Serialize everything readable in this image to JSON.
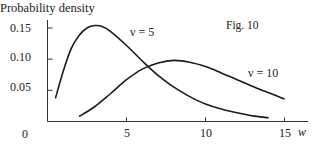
{
  "chart_data": {
    "type": "line",
    "title": "",
    "figure_label": "Fig. 10",
    "xlabel": "w",
    "ylabel": "Probability density",
    "xlim": [
      0,
      16
    ],
    "ylim": [
      0,
      0.16
    ],
    "grid": false,
    "legend": "none (inline curve annotations)",
    "x_ticks": [
      5,
      10,
      15
    ],
    "x_tick_labels": [
      "5",
      "10",
      "15"
    ],
    "y_ticks": [
      0.05,
      0.1,
      0.15
    ],
    "y_tick_labels": [
      "0.05",
      "0.10",
      "0.15"
    ],
    "origin_label": "0",
    "series": [
      {
        "name": "ν = 5",
        "annotation": "ν = 5",
        "x": [
          0.5,
          1,
          1.5,
          2,
          2.5,
          3,
          3.5,
          4,
          5,
          6,
          7,
          8,
          9,
          10,
          11,
          12,
          13,
          14
        ],
        "values": [
          0.037,
          0.081,
          0.117,
          0.138,
          0.15,
          0.154,
          0.152,
          0.144,
          0.122,
          0.097,
          0.074,
          0.055,
          0.04,
          0.028,
          0.02,
          0.014,
          0.009,
          0.006
        ]
      },
      {
        "name": "ν = 10",
        "annotation": "ν = 10",
        "x": [
          2,
          3,
          4,
          5,
          6,
          7,
          8,
          9,
          10,
          11,
          12,
          13,
          14,
          15
        ],
        "values": [
          0.008,
          0.024,
          0.045,
          0.067,
          0.084,
          0.094,
          0.098,
          0.095,
          0.088,
          0.078,
          0.067,
          0.056,
          0.046,
          0.036
        ]
      }
    ]
  },
  "labels": {
    "ylabel": "Probability density",
    "figure": "Fig. 10",
    "origin": "0",
    "xlabel": "w",
    "y_ticks": [
      "0.15",
      "0.10",
      "0.05"
    ],
    "x_ticks": [
      "5",
      "10",
      "15"
    ],
    "series_annotations": [
      "ν = 5",
      "ν = 10"
    ]
  },
  "colors": {
    "line": "#1a1a1a",
    "axis": "#333333",
    "background": "#ffffff"
  }
}
